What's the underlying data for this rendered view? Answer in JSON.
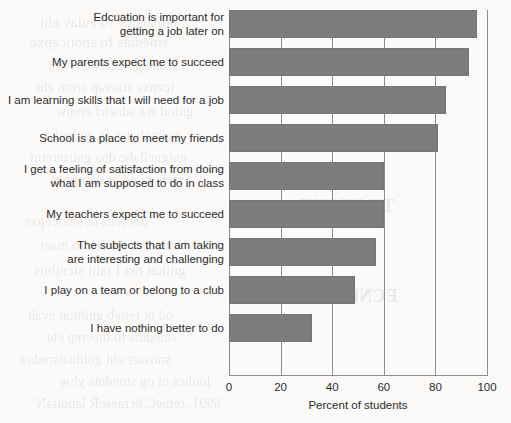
{
  "chart_data": {
    "type": "bar",
    "orientation": "horizontal",
    "title": "",
    "subtitle": "",
    "xlabel": "Percent of students",
    "ylabel": "",
    "xlim": [
      0,
      100
    ],
    "xticks": [
      0,
      20,
      40,
      60,
      80,
      100
    ],
    "xtick_labels": [
      "0",
      "20",
      "40",
      "60",
      "80",
      "100"
    ],
    "grid": "vertical",
    "legend": "none",
    "bar_color": "#7c7c7c",
    "categories": [
      "Edcuation is important for getting a job later on",
      "My parents expect me to succeed",
      "I am learning skills that I will need for a job",
      "School is a place to meet my friends",
      "I get a feeling of satisfaction from doing what I am supposed to do in class",
      "My teachers expect me to succeed",
      "The subjects that I am taking are interesting and challenging",
      "I play on a team or belong to a club",
      "I have nothing better to do"
    ],
    "category_lines": [
      [
        "Edcuation is important for",
        "getting a job later on"
      ],
      [
        "My parents expect me to succeed"
      ],
      [
        "I am learning skills that I will need for a job"
      ],
      [
        "School is a place to meet my friends"
      ],
      [
        "I get a feeling of satisfaction from doing",
        "what I am supposed to do in class"
      ],
      [
        "My teachers expect me to succeed"
      ],
      [
        "The subjects that I am taking",
        "are interesting and challenging"
      ],
      [
        "I play on a team or belong to a club"
      ],
      [
        "I have nothing better to do"
      ]
    ],
    "values": [
      96,
      93,
      84,
      81,
      60,
      60,
      57,
      49,
      32
    ]
  },
  "axis": {
    "x_title": "Percent of students"
  },
  "bleed_through_text": [
    "THOUGHT",
    "VIOLENCE"
  ]
}
